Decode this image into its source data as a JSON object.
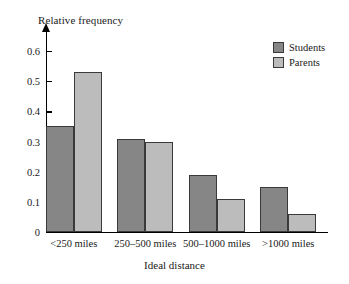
{
  "chart_data": {
    "type": "bar",
    "title": "",
    "xlabel": "Ideal distance",
    "ylabel": "Relative frequency",
    "categories": [
      "<250 miles",
      "250–500 miles",
      "500–1000 miles",
      ">1000 miles"
    ],
    "series": [
      {
        "name": "Students",
        "values": [
          0.35,
          0.31,
          0.19,
          0.15
        ],
        "color": "#868686"
      },
      {
        "name": "Parents",
        "values": [
          0.53,
          0.3,
          0.11,
          0.06
        ],
        "color": "#bcbcbc"
      }
    ],
    "ylim": [
      0,
      0.65
    ],
    "yticks": [
      0,
      0.1,
      0.2,
      0.3,
      0.4,
      0.5,
      0.6
    ],
    "ytick_labels": [
      "0",
      "0.1",
      "0.2",
      "0.3",
      "0.4",
      "0.5",
      "0.6"
    ],
    "grid": false,
    "legend_position": "top-right"
  }
}
